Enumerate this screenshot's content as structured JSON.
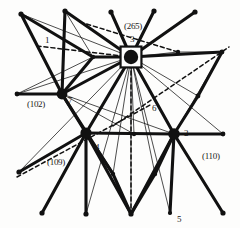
{
  "figure": {
    "background": "#fdfdfc",
    "ink": "#111111",
    "width": 240,
    "height": 228
  },
  "nodes": [
    {
      "id": "n3",
      "label": "3",
      "type": "hub-boxed",
      "x": 131,
      "y": 57,
      "r": 7.2,
      "label_dx": -3,
      "label_dy": -18
    },
    {
      "id": "n7",
      "label": "7",
      "type": "major",
      "x": 62,
      "y": 94,
      "r": 5.4,
      "label_dx": 4,
      "label_dy": 2
    },
    {
      "id": "n4",
      "label": "4",
      "type": "major",
      "x": 86,
      "y": 133,
      "r": 5.6,
      "label_dx": 7,
      "label_dy": 7
    },
    {
      "id": "n2",
      "label": "2",
      "type": "major",
      "x": 174,
      "y": 134,
      "r": 5.8,
      "label_dx": 7,
      "label_dy": -6
    },
    {
      "id": "n6",
      "label": "6",
      "type": "none",
      "x": 152,
      "y": 104,
      "r": 0,
      "label_dx": 0,
      "label_dy": 0
    },
    {
      "id": "n5",
      "label": "5",
      "type": "minor",
      "x": 170,
      "y": 213,
      "r": 2.1,
      "label_dx": 5,
      "label_dy": 3
    },
    {
      "id": "n1",
      "label": "1",
      "type": "none",
      "x": 46,
      "y": 38,
      "r": 0,
      "label_dx": 0,
      "label_dy": 0
    }
  ],
  "index_labels": [
    {
      "text": "(265)",
      "x": 124,
      "y": 22
    },
    {
      "text": "(102)",
      "x": 27,
      "y": 100
    },
    {
      "text": "(109)",
      "x": 47,
      "y": 158
    },
    {
      "text": "(110)",
      "x": 202,
      "y": 152
    }
  ],
  "node_labels": [
    {
      "text": "3",
      "x": 130,
      "y": 35
    },
    {
      "text": "7",
      "x": 68,
      "y": 96
    },
    {
      "text": "4",
      "x": 95,
      "y": 143
    },
    {
      "text": "2",
      "x": 184,
      "y": 129
    },
    {
      "text": "6",
      "x": 152,
      "y": 104
    },
    {
      "text": "5",
      "x": 177,
      "y": 215
    },
    {
      "text": "1",
      "x": 45,
      "y": 36
    }
  ],
  "terminals": [
    {
      "id": "t1",
      "x": 21,
      "y": 14,
      "r": 2.6
    },
    {
      "id": "t2",
      "x": 65,
      "y": 11,
      "r": 2.6
    },
    {
      "id": "t3",
      "x": 111,
      "y": 12,
      "r": 2.6
    },
    {
      "id": "t4",
      "x": 154,
      "y": 11,
      "r": 2.6
    },
    {
      "id": "t5",
      "x": 195,
      "y": 12,
      "r": 2.6
    },
    {
      "id": "t6",
      "x": 17,
      "y": 94,
      "r": 2.4
    },
    {
      "id": "t7",
      "x": 222,
      "y": 52,
      "r": 2.4
    },
    {
      "id": "t8",
      "x": 178,
      "y": 52,
      "r": 2.2
    },
    {
      "id": "t9",
      "x": 198,
      "y": 96,
      "r": 2.4
    },
    {
      "id": "t10",
      "x": 223,
      "y": 134,
      "r": 2.4
    },
    {
      "id": "t11",
      "x": 134,
      "y": 134,
      "r": 2.2
    },
    {
      "id": "t12",
      "x": 19,
      "y": 172,
      "r": 2.6
    },
    {
      "id": "t13",
      "x": 42,
      "y": 213,
      "r": 2.6
    },
    {
      "id": "t14",
      "x": 86,
      "y": 214,
      "r": 2.6
    },
    {
      "id": "t15",
      "x": 131,
      "y": 214,
      "r": 2.6
    },
    {
      "id": "t16",
      "x": 223,
      "y": 213,
      "r": 2.6
    },
    {
      "id": "t17",
      "x": 113,
      "y": 174,
      "r": 2.2
    },
    {
      "id": "t18",
      "x": 155,
      "y": 174,
      "r": 2.2
    },
    {
      "id": "t19",
      "x": 93,
      "y": 57,
      "r": 2.2
    }
  ],
  "edges_thick": [
    {
      "from": "21,14",
      "to": "62,94"
    },
    {
      "from": "65,11",
      "to": "62,94"
    },
    {
      "from": "111,12",
      "to": "131,57"
    },
    {
      "from": "154,11",
      "to": "131,57"
    },
    {
      "from": "195,12",
      "to": "131,57"
    },
    {
      "from": "65,11",
      "to": "131,57"
    },
    {
      "from": "21,14",
      "to": "93,57"
    },
    {
      "from": "93,57",
      "to": "131,57"
    },
    {
      "from": "131,57",
      "to": "222,52"
    },
    {
      "from": "131,57",
      "to": "86,133"
    },
    {
      "from": "131,57",
      "to": "174,134"
    },
    {
      "from": "62,94",
      "to": "131,57"
    },
    {
      "from": "62,94",
      "to": "17,94"
    },
    {
      "from": "62,94",
      "to": "93,57"
    },
    {
      "from": "62,94",
      "to": "86,133"
    },
    {
      "from": "222,52",
      "to": "198,96"
    },
    {
      "from": "198,96",
      "to": "174,134"
    },
    {
      "from": "86,133",
      "to": "174,134"
    },
    {
      "from": "174,134",
      "to": "223,134"
    },
    {
      "from": "86,133",
      "to": "19,172"
    },
    {
      "from": "86,133",
      "to": "42,213"
    },
    {
      "from": "86,133",
      "to": "86,214"
    },
    {
      "from": "86,133",
      "to": "131,214"
    },
    {
      "from": "86,133",
      "to": "113,174"
    },
    {
      "from": "174,134",
      "to": "131,214"
    },
    {
      "from": "174,134",
      "to": "155,174"
    },
    {
      "from": "174,134",
      "to": "223,213"
    },
    {
      "from": "174,134",
      "to": "170,213"
    },
    {
      "from": "113,174",
      "to": "131,214"
    },
    {
      "from": "155,174",
      "to": "131,214"
    },
    {
      "from": "62,94",
      "to": "113,174"
    }
  ],
  "edges_thin": [
    {
      "from": "21,14",
      "to": "131,57"
    },
    {
      "from": "65,11",
      "to": "93,57"
    },
    {
      "from": "17,94",
      "to": "131,57"
    },
    {
      "from": "131,57",
      "to": "198,96"
    },
    {
      "from": "131,57",
      "to": "223,134"
    },
    {
      "from": "131,57",
      "to": "178,52"
    },
    {
      "from": "178,52",
      "to": "222,52"
    },
    {
      "from": "131,57",
      "to": "19,172"
    },
    {
      "from": "131,57",
      "to": "86,214"
    },
    {
      "from": "131,57",
      "to": "131,214"
    },
    {
      "from": "131,57",
      "to": "113,174"
    },
    {
      "from": "131,57",
      "to": "155,174"
    },
    {
      "from": "131,57",
      "to": "170,213"
    },
    {
      "from": "131,57",
      "to": "134,134"
    },
    {
      "from": "131,57",
      "to": "86,133"
    },
    {
      "from": "62,94",
      "to": "174,134"
    },
    {
      "from": "62,94",
      "to": "134,134"
    },
    {
      "from": "86,133",
      "to": "134,134"
    },
    {
      "from": "134,134",
      "to": "174,134"
    },
    {
      "from": "17,94",
      "to": "62,94"
    },
    {
      "from": "86,133",
      "to": "62,94"
    },
    {
      "from": "174,134",
      "to": "198,96"
    },
    {
      "from": "174,134",
      "to": "222,52"
    },
    {
      "from": "93,57",
      "to": "17,94"
    },
    {
      "from": "42,213",
      "to": "86,133"
    },
    {
      "from": "19,172",
      "to": "86,133"
    }
  ],
  "edges_dashed": [
    {
      "from": "80,22",
      "to": "178,52"
    },
    {
      "from": "37,46",
      "to": "131,57"
    },
    {
      "from": "17,177",
      "to": "152,104"
    },
    {
      "from": "113,126",
      "to": "229,47"
    },
    {
      "from": "131,57",
      "to": "131,214"
    }
  ],
  "legend": {
    "note": "thick lines = primary lattice bonds; thin lines = secondary connections; dashed = trace directions"
  }
}
